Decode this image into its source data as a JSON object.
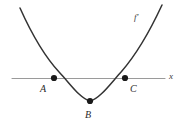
{
  "figure": {
    "kind": "graph-of-derivative",
    "background_color": "#ffffff",
    "curve_color": "#333333",
    "axis_color": "#9a9a9a",
    "point_color": "#1a1a1a",
    "label_color": "#2b2b2b"
  },
  "axis": {
    "name": "x-axis",
    "label": "x",
    "y_position": 78,
    "x_start": 12,
    "x_end": 165
  },
  "curve": {
    "label": "f′",
    "shape": "parabola-opening-upward",
    "vertex": {
      "x": 90,
      "y": 101
    },
    "left_end": {
      "x": 20,
      "y": 8
    },
    "right_end": {
      "x": 162,
      "y": 5
    }
  },
  "points": [
    {
      "id": "A",
      "label": "A",
      "x": 54,
      "y": 78,
      "role": "left-x-intercept"
    },
    {
      "id": "B",
      "label": "B",
      "x": 90,
      "y": 101,
      "role": "vertex-minimum"
    },
    {
      "id": "C",
      "label": "C",
      "x": 125,
      "y": 78,
      "role": "right-x-intercept"
    }
  ]
}
